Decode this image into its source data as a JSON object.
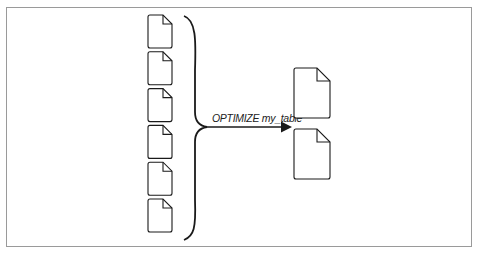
{
  "diagram": {
    "title": "",
    "input_files": {
      "count": 6,
      "icon": "document-icon"
    },
    "output_files": {
      "count": 2,
      "icon": "document-icon"
    },
    "operation_label": "OPTIMIZE my_table",
    "arrow_direction": "right",
    "colors": {
      "stroke": "#1a1a1a",
      "frame": "#9a9a9a",
      "background": "#ffffff"
    }
  }
}
